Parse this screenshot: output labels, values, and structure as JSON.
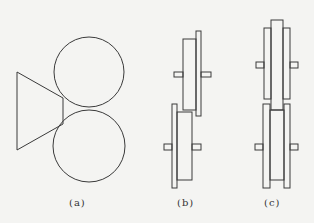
{
  "figure": {
    "stroke_color": "#3a3a3a",
    "background": "#f4f4f2",
    "panels": [
      {
        "id": "a",
        "label": "(a)",
        "description": "Two circles stacked vertically with a trapezoid/triangle wedge on the left touching the gap"
      },
      {
        "id": "b",
        "label": "(b)",
        "description": "Two offset pulleys/wheels side view, staggered"
      },
      {
        "id": "c",
        "label": "(c)",
        "description": "Two pulleys/wheels side view, aligned with grooved flanges"
      }
    ]
  }
}
